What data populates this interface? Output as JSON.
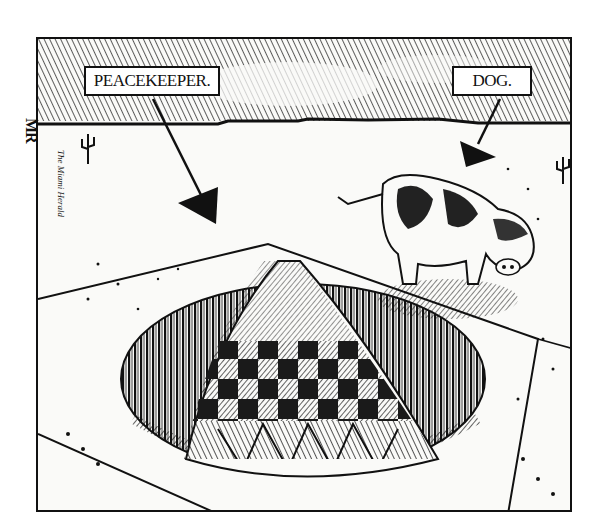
{
  "cartoon": {
    "type": "editorial cartoon",
    "style": "black-and-white pen-and-ink cross-hatching",
    "labels": {
      "missile": "PEACEKEEPER.",
      "animal": "DOG."
    },
    "signature": {
      "artist": "MR",
      "publication": "The Miami Herald"
    },
    "scene": {
      "subjects": [
        "missile warhead in silo",
        "dog",
        "desert landscape",
        "cacti"
      ],
      "colors": {
        "ink": "#111111",
        "paper": "#fafaf8"
      }
    }
  }
}
